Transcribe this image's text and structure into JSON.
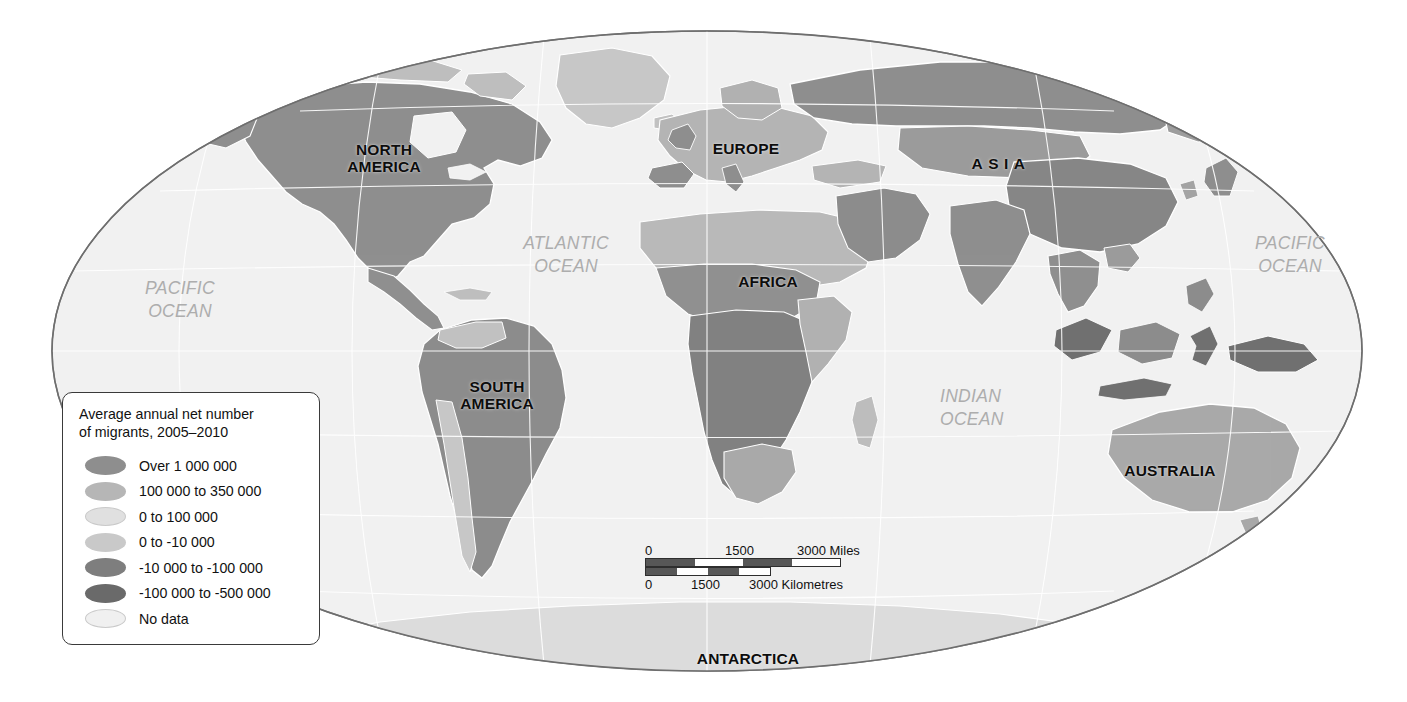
{
  "map": {
    "projection": "Mollweide",
    "background_color": "#ffffff",
    "ocean_color": "#f1f1f1",
    "outline_color": "#6e6e6e",
    "graticule_color": "#ffffff",
    "country_border_color": "#ffffff",
    "continent_labels": [
      {
        "name": "north-america",
        "text": "NORTH\nAMERICA",
        "x": 384,
        "y": 150
      },
      {
        "name": "europe",
        "text": "EUROPE",
        "x": 746,
        "y": 148
      },
      {
        "name": "asia",
        "text": "ASIA",
        "x": 1001,
        "y": 163
      },
      {
        "name": "africa",
        "text": "AFRICA",
        "x": 768,
        "y": 281
      },
      {
        "name": "south-america",
        "text": "SOUTH\nAMERICA",
        "x": 497,
        "y": 387
      },
      {
        "name": "australia",
        "text": "AUSTRALIA",
        "x": 1170,
        "y": 470
      },
      {
        "name": "antarctica",
        "text": "ANTARCTICA",
        "x": 748,
        "y": 658
      }
    ],
    "ocean_labels": [
      {
        "name": "pacific-ocean-west",
        "text": "PACIFIC\nOCEAN",
        "x": 180,
        "y": 288,
        "align": "center"
      },
      {
        "name": "atlantic-ocean",
        "text": "ATLANTIC\nOCEAN",
        "x": 566,
        "y": 243,
        "align": "center"
      },
      {
        "name": "pacific-ocean-east",
        "text": "PACIFIC\nOCEAN",
        "x": 1290,
        "y": 243,
        "align": "center"
      },
      {
        "name": "indian-ocean",
        "text": "INDIAN\nOCEAN",
        "x": 958,
        "y": 396,
        "align": "left"
      }
    ]
  },
  "legend": {
    "title": "Average annual net number\nof migrants, 2005–2010",
    "items": [
      {
        "label": "Over 1 000 000",
        "color": "#8e8e8e",
        "outlined": false
      },
      {
        "label": "100 000 to 350 000",
        "color": "#b6b6b6",
        "outlined": false
      },
      {
        "label": "0 to 100 000",
        "color": "#e0e0e0",
        "outlined": true
      },
      {
        "label": "0 to -10 000",
        "color": "#c9c9c9",
        "outlined": false
      },
      {
        "label": "-10 000 to -100 000",
        "color": "#7e7e7e",
        "outlined": false
      },
      {
        "label": "-100 000 to -500 000",
        "color": "#6a6a6a",
        "outlined": false
      },
      {
        "label": "No data",
        "color": "#f0f0f0",
        "outlined": true
      }
    ]
  },
  "scalebar": {
    "miles": {
      "unit_label": "3000 Miles",
      "ticks": [
        "0",
        "1500",
        "3000 Miles"
      ],
      "segments": [
        "dark",
        "light",
        "dark",
        "light"
      ]
    },
    "kilometres": {
      "unit_label": "3000 Kilometres",
      "ticks": [
        "0",
        "1500",
        "3000 Kilometres"
      ],
      "segments": [
        "dark",
        "light",
        "dark",
        "light"
      ]
    }
  }
}
